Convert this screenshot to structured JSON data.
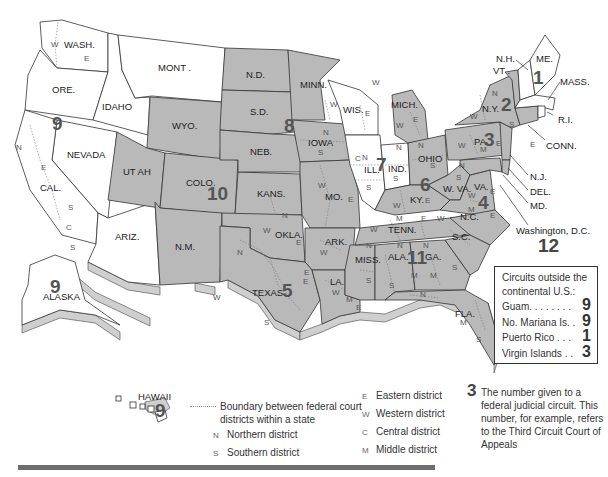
{
  "colors": {
    "circuit_fill_white": "#ffffff",
    "circuit_fill_gray": "#b9b9b9",
    "border": "#333333",
    "rule": "#6e6e6e"
  },
  "states": {
    "wash": "WASH.",
    "ore": "ORE.",
    "cal": "CAL.",
    "nevada": "NEVADA",
    "idaho": "IDAHO",
    "mont": "MONT .",
    "ariz": "ARIZ.",
    "utah": "UT AH",
    "wyo": "WYO.",
    "colo": "COLO.",
    "nm": "N.M.",
    "nd": "N.D.",
    "sd": "S.D.",
    "neb": "NEB.",
    "kans": "KANS.",
    "okla": "OKLA.",
    "texas": "TEXAS",
    "minn": "MINN.",
    "iowa": "IOWA",
    "mo": "MO.",
    "ark": "ARK.",
    "la": "LA.",
    "wis": "WIS.",
    "ill": "ILL.",
    "ind": "IND.",
    "mich": "MICH.",
    "ohio": "OHIO",
    "ky": "KY.",
    "tenn": "TENN.",
    "miss": "MISS.",
    "ala": "ALA.",
    "ga": "GA.",
    "fla": "FLA.",
    "sc": "S.C.",
    "nc": "N.C.",
    "va": "VA.",
    "wva": "W. VA.",
    "pa": "PA.",
    "ny": "N.Y.",
    "vt": "VT .",
    "nh": "N.H.",
    "me": "ME.",
    "mass": "MASS.",
    "ri": "R.I.",
    "conn": "CONN.",
    "nj": "N.J.",
    "del": "DEL.",
    "md": "MD.",
    "dc": "Washington, D.C.",
    "alaska": "ALASKA",
    "hawaii": "HAWAII"
  },
  "circuits": {
    "c1": "1",
    "c2": "2",
    "c3": "3",
    "c4": "4",
    "c5": "5",
    "c6": "6",
    "c7": "7",
    "c8": "8",
    "c9": "9",
    "c9_alaska": "9",
    "c9_hawaii": "9",
    "c10": "10",
    "c11": "11",
    "c12": "12"
  },
  "district_letters": {
    "n": "N",
    "s": "S",
    "e": "E",
    "w": "W",
    "c": "C",
    "m": "M"
  },
  "outside_box": {
    "title_line1": "Circuits outside the",
    "title_line2": "continental U.S.:",
    "rows": [
      {
        "label": "Guam. . . . . . . .",
        "circuit": "9"
      },
      {
        "label": "No. Mariana Is. .",
        "circuit": "9"
      },
      {
        "label": "Puerto Rico . . .",
        "circuit": "1"
      },
      {
        "label": "Virgin Islands . .",
        "circuit": "3"
      }
    ]
  },
  "legend": {
    "boundary": "Boundary between federal court districts within a state",
    "northern": {
      "key": "N",
      "label": "Northern district"
    },
    "southern": {
      "key": "S",
      "label": "Southern district"
    },
    "eastern": {
      "key": "E",
      "label": "Eastern district"
    },
    "western": {
      "key": "W",
      "label": "Western district"
    },
    "central": {
      "key": "C",
      "label": "Central district"
    },
    "middle": {
      "key": "M",
      "label": "Middle district"
    },
    "number_example": {
      "key": "3",
      "label": "The number given to a federal judicial circuit. This number, for example, refers to the Third Circuit Court of Appeals"
    }
  }
}
